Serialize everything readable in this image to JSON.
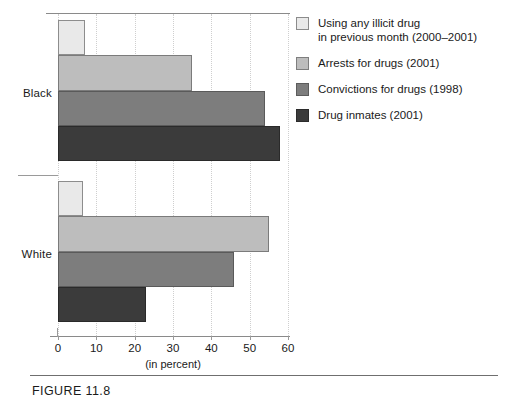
{
  "figure": {
    "caption": "FIGURE 11.8"
  },
  "chart_data": {
    "type": "bar",
    "orientation": "horizontal",
    "title": "",
    "xlabel": "(in percent)",
    "ylabel": "",
    "xlim": [
      0,
      60
    ],
    "xticks": [
      0,
      10,
      20,
      30,
      40,
      50,
      60
    ],
    "xtick_labels": [
      "0",
      "10",
      "20",
      "30",
      "40",
      "50",
      "60"
    ],
    "grid": "vertical-dotted",
    "legend_position": "right",
    "categories": [
      "Black",
      "White"
    ],
    "series": [
      {
        "name": "Using any illicit drug in previous month (2000–2001)",
        "legend_line1": "Using any illicit drug",
        "legend_line2": "in previous month (2000–2001)",
        "color": "#e9e9e9",
        "values": [
          7,
          6.5
        ]
      },
      {
        "name": "Arrests for drugs (2001)",
        "legend_line1": "Arrests for drugs (2001)",
        "legend_line2": "",
        "color": "#bdbdbd",
        "values": [
          35,
          55
        ]
      },
      {
        "name": "Convictions for drugs (1998)",
        "legend_line1": "Convictions for drugs (1998)",
        "legend_line2": "",
        "color": "#7d7d7d",
        "values": [
          54,
          46
        ]
      },
      {
        "name": "Drug inmates (2001)",
        "legend_line1": "Drug inmates (2001)",
        "legend_line2": "",
        "color": "#3b3b3b",
        "values": [
          58,
          23
        ]
      }
    ]
  }
}
